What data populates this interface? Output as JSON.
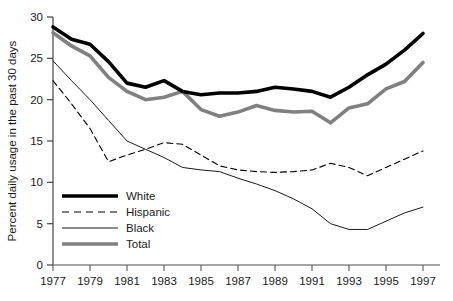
{
  "chart_data": {
    "type": "line",
    "title": "",
    "xlabel": "",
    "ylabel": "Percent daily usage in the past 30 days",
    "xlim": [
      1977,
      1997
    ],
    "ylim": [
      0,
      30
    ],
    "grid": false,
    "legend_position": "lower-left-inside",
    "x": [
      1977,
      1978,
      1979,
      1980,
      1981,
      1982,
      1983,
      1984,
      1985,
      1986,
      1987,
      1988,
      1989,
      1990,
      1991,
      1992,
      1993,
      1994,
      1995,
      1996,
      1997
    ],
    "xticks": [
      1977,
      1979,
      1981,
      1983,
      1985,
      1987,
      1989,
      1991,
      1993,
      1995,
      1997
    ],
    "xtick_labels": [
      "1977",
      "1979",
      "1981",
      "1983",
      "1985",
      "1987",
      "1989",
      "1991",
      "1993",
      "1995",
      "1997"
    ],
    "yticks": [
      0,
      5,
      10,
      15,
      20,
      25,
      30
    ],
    "ytick_labels": [
      "0",
      "5",
      "10",
      "15",
      "20",
      "25",
      "30"
    ],
    "series": [
      {
        "name": "White",
        "style": "thick-solid-black",
        "color": "#000000",
        "values": [
          28.8,
          27.3,
          26.7,
          24.6,
          22.0,
          21.5,
          22.3,
          21.0,
          20.6,
          20.8,
          20.8,
          21.0,
          21.5,
          21.3,
          21.0,
          20.3,
          21.5,
          23.0,
          24.3,
          26.0,
          28.0
        ]
      },
      {
        "name": "Hispanic",
        "style": "dashed-thin-black",
        "color": "#000000",
        "values": [
          22.3,
          19.5,
          16.5,
          12.5,
          13.3,
          14.0,
          14.8,
          14.6,
          13.3,
          12.0,
          11.5,
          11.3,
          11.2,
          11.3,
          11.5,
          12.3,
          11.8,
          10.8,
          11.8,
          12.8,
          13.8
        ]
      },
      {
        "name": "Black",
        "style": "thin-solid-black",
        "color": "#000000",
        "values": [
          24.7,
          22.3,
          20.0,
          17.5,
          15.0,
          14.0,
          13.0,
          11.8,
          11.5,
          11.3,
          10.5,
          9.8,
          9.0,
          8.0,
          6.8,
          5.0,
          4.3,
          4.3,
          5.3,
          6.3,
          7.0
        ]
      },
      {
        "name": "Total",
        "style": "thick-solid-gray",
        "color": "#808080",
        "values": [
          28.1,
          26.5,
          25.3,
          22.7,
          21.0,
          20.0,
          20.3,
          21.0,
          18.8,
          18.0,
          18.5,
          19.3,
          18.7,
          18.5,
          18.6,
          17.2,
          19.0,
          19.5,
          21.3,
          22.2,
          24.5
        ]
      }
    ],
    "legend": [
      {
        "label": "White",
        "style": "thick-solid-black",
        "color": "#000000"
      },
      {
        "label": "Hispanic",
        "style": "dashed-thin-black",
        "color": "#000000"
      },
      {
        "label": "Black",
        "style": "thin-solid-black",
        "color": "#000000"
      },
      {
        "label": "Total",
        "style": "thick-solid-gray",
        "color": "#808080"
      }
    ]
  },
  "axes": {
    "y_title": "Percent daily usage in the past 30 days"
  }
}
